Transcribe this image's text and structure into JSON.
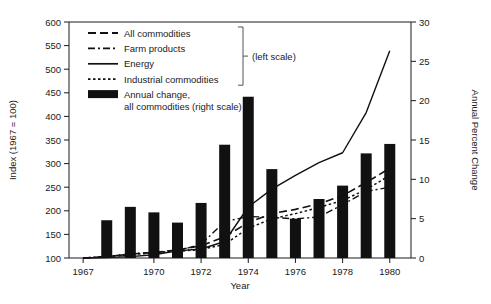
{
  "chart_data": {
    "type": "bar",
    "title": "",
    "xlabel": "Year",
    "ylabel": "Index (1967 = 100)",
    "ylabel_right": "Annual Percent Change",
    "xlim": [
      1966.4,
      1980.9
    ],
    "ylim": [
      100,
      600
    ],
    "ylim_right": [
      0,
      30
    ],
    "yticks": [
      100,
      150,
      200,
      250,
      300,
      350,
      400,
      450,
      500,
      550,
      600
    ],
    "yticks_right": [
      0,
      5,
      10,
      15,
      20,
      25,
      30
    ],
    "xticks": [
      1967,
      1970,
      1972,
      1974,
      1976,
      1978,
      1980
    ],
    "xticklabels": [
      "1967",
      "1970",
      "1972",
      "1974",
      "1976",
      "1978",
      "1980"
    ],
    "grid": false,
    "legend_position": "upper-left-inside",
    "categories": [
      1967,
      1968,
      1969,
      1970,
      1971,
      1972,
      1973,
      1974,
      1975,
      1976,
      1977,
      1978,
      1979,
      1980
    ],
    "bars": {
      "name": "Annual change, all commodities (right scale)",
      "axis": "right",
      "color": "#111111",
      "x": [
        1968,
        1969,
        1970,
        1971,
        1972,
        1973,
        1974,
        1975,
        1976,
        1977,
        1978,
        1979,
        1980
      ],
      "values": [
        4.8,
        6.5,
        5.8,
        4.5,
        7.0,
        14.4,
        20.5,
        11.3,
        5.0,
        7.5,
        9.2,
        13.3,
        14.5
      ]
    },
    "series": [
      {
        "name": "All commodities",
        "axis": "left",
        "style": "dashed",
        "color": "#111111",
        "x": [
          1967,
          1968,
          1969,
          1970,
          1971,
          1972,
          1973,
          1974,
          1975,
          1976,
          1977,
          1978,
          1979,
          1980
        ],
        "values": [
          100,
          103,
          108,
          112,
          117,
          126,
          145,
          175,
          194,
          203,
          215,
          232,
          260,
          290
        ]
      },
      {
        "name": "Farm products",
        "axis": "left",
        "style": "dash-dot",
        "color": "#111111",
        "x": [
          1967,
          1968,
          1969,
          1970,
          1971,
          1972,
          1973,
          1974,
          1975,
          1976,
          1977,
          1978,
          1979,
          1980
        ],
        "values": [
          100,
          103,
          109,
          112,
          115,
          129,
          177,
          188,
          186,
          183,
          187,
          213,
          241,
          250
        ]
      },
      {
        "name": "Energy",
        "axis": "left",
        "style": "solid",
        "color": "#111111",
        "x": [
          1967,
          1968,
          1969,
          1970,
          1971,
          1972,
          1973,
          1974,
          1975,
          1976,
          1977,
          1978,
          1979,
          1980
        ],
        "values": [
          100,
          101,
          103,
          107,
          115,
          119,
          135,
          208,
          246,
          275,
          302,
          323,
          408,
          539
        ]
      },
      {
        "name": "Industrial commodities",
        "axis": "left",
        "style": "dotted",
        "color": "#111111",
        "x": [
          1967,
          1968,
          1969,
          1970,
          1971,
          1972,
          1973,
          1974,
          1975,
          1976,
          1977,
          1978,
          1979,
          1980
        ],
        "values": [
          100,
          103,
          107,
          111,
          114,
          118,
          129,
          163,
          183,
          194,
          207,
          222,
          245,
          275
        ]
      }
    ],
    "annotations": [
      {
        "text": "(left scale)",
        "refers_to": [
          "All commodities",
          "Farm products",
          "Energy",
          "Industrial commodities"
        ]
      },
      {
        "text": "(right scale)",
        "refers_to": [
          "Annual change, all commodities"
        ]
      }
    ]
  },
  "legend": {
    "items": [
      {
        "label": "All commodities",
        "swatch": "dashed-line-swatch"
      },
      {
        "label": "Farm products",
        "swatch": "dash-dot-line-swatch"
      },
      {
        "label": "Energy",
        "swatch": "solid-line-swatch"
      },
      {
        "label": "Industrial commodities",
        "swatch": "dotted-line-swatch"
      },
      {
        "label": "Annual change,",
        "label2": "all commodities (right scale)",
        "swatch": "filled-bar-swatch"
      }
    ],
    "bracket_note": "(left scale)"
  },
  "axes": {
    "left_title": "Index (1967 = 100)",
    "right_title": "Annual Percent Change",
    "bottom_title": "Year"
  }
}
